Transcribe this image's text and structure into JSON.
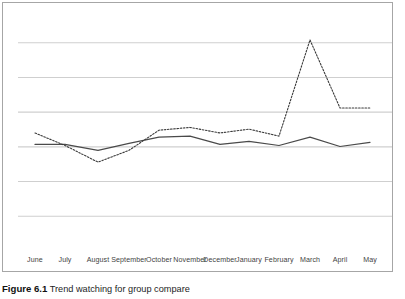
{
  "figure": {
    "caption_label": "Figure 6.1",
    "caption_text": "Trend watching for group compare"
  },
  "chart_data": {
    "type": "line",
    "title": "",
    "xlabel": "",
    "ylabel": "",
    "grid": true,
    "gridlines": 6,
    "legend": "none",
    "categories": [
      "June",
      "July",
      "August",
      "September",
      "October",
      "November",
      "December",
      "January",
      "February",
      "March",
      "April",
      "May"
    ],
    "ylim": [
      0,
      7
    ],
    "yticks": [
      1,
      2,
      3,
      4,
      5,
      6
    ],
    "series": [
      {
        "name": "Series 1",
        "style": "solid",
        "color": "#4a4a4a",
        "values": [
          3.07,
          3.07,
          2.9,
          3.1,
          3.28,
          3.31,
          3.07,
          3.16,
          3.04,
          3.28,
          3.01,
          3.13
        ]
      },
      {
        "name": "Series 2",
        "style": "dotted",
        "color": "#3a3a3a",
        "values": [
          3.4,
          3.04,
          2.56,
          2.9,
          3.48,
          3.56,
          3.4,
          3.51,
          3.31,
          6.08,
          4.12,
          4.12
        ]
      }
    ],
    "annotations": [
      {
        "label": "peak",
        "category": "March",
        "series": "Series 2",
        "value": 6.08
      }
    ]
  },
  "x_axis": {
    "ticks": [
      {
        "label": "June",
        "x": 32
      },
      {
        "label": "July",
        "x": 62
      },
      {
        "label": "August",
        "x": 95
      },
      {
        "label": "September",
        "x": 126
      },
      {
        "label": "October",
        "x": 156
      },
      {
        "label": "November",
        "x": 187
      },
      {
        "label": "December",
        "x": 217
      },
      {
        "label": "January",
        "x": 246
      },
      {
        "label": "February",
        "x": 276
      },
      {
        "label": "March",
        "x": 307
      },
      {
        "label": "April",
        "x": 337
      },
      {
        "label": "May",
        "x": 367
      }
    ]
  },
  "colors": {
    "frame_border": "#a6a6a6",
    "gridline": "#cfcfcf",
    "series_solid": "#4a4a4a",
    "series_dotted": "#3a3a3a",
    "tick_label": "#3f3f3f",
    "background": "#ffffff"
  }
}
